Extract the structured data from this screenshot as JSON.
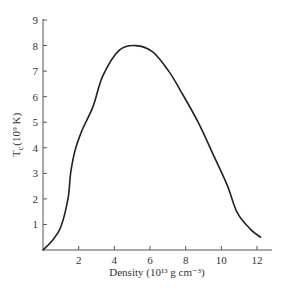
{
  "chart_data": {
    "type": "line",
    "title": "",
    "xlabel": "Density (10¹³ g cm⁻³)",
    "ylabel_main": "T",
    "ylabel_sub": "c",
    "ylabel_rest": "(10⁹ K)",
    "xlim": [
      0,
      13
    ],
    "ylim": [
      0,
      9
    ],
    "grid": false,
    "legend": null,
    "x_ticks": [
      2,
      4,
      6,
      8,
      10,
      12
    ],
    "y_ticks": [
      1,
      2,
      3,
      4,
      5,
      6,
      7,
      8,
      9
    ],
    "series": [
      {
        "name": "T_c",
        "x": [
          0.0,
          0.5,
          1.0,
          1.4,
          1.55,
          1.8,
          2.2,
          2.8,
          3.35,
          4.25,
          5.2,
          6.15,
          7.05,
          7.7,
          8.7,
          9.6,
          10.35,
          10.9,
          11.65,
          12.2
        ],
        "y": [
          0.0,
          0.35,
          0.9,
          2.0,
          3.0,
          3.9,
          4.7,
          5.6,
          6.8,
          7.8,
          8.0,
          7.75,
          7.0,
          6.25,
          5.0,
          3.65,
          2.5,
          1.45,
          0.8,
          0.5
        ]
      }
    ]
  }
}
